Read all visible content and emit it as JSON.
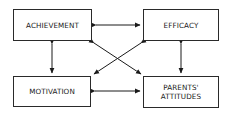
{
  "diagram": {
    "nodes": [
      {
        "id": "achievement",
        "label": "ACHIEVEMENT"
      },
      {
        "id": "efficacy",
        "label": "EFFICACY"
      },
      {
        "id": "motivation",
        "label": "MOTIVATION"
      },
      {
        "id": "parents_attitudes",
        "label": "PARENTS'\nATTITUDES"
      }
    ],
    "edges": [
      {
        "from": "achievement",
        "to": "efficacy",
        "type": "bidirectional"
      },
      {
        "from": "achievement",
        "to": "motivation",
        "type": "bidirectional"
      },
      {
        "from": "efficacy",
        "to": "parents_attitudes",
        "type": "bidirectional"
      },
      {
        "from": "motivation",
        "to": "parents_attitudes",
        "type": "bidirectional"
      },
      {
        "from": "achievement",
        "to": "parents_attitudes",
        "type": "bidirectional"
      },
      {
        "from": "efficacy",
        "to": "motivation",
        "type": "bidirectional"
      }
    ]
  }
}
